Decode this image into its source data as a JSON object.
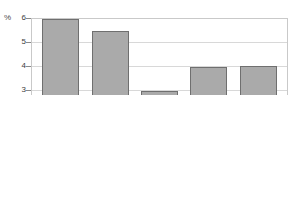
{
  "chart_data": {
    "type": "bar",
    "title": "",
    "subtitle": "",
    "xlabel": "",
    "ylabel": "%",
    "unit_label": "%",
    "categories": [
      "2006",
      "2007",
      "2008",
      "2009",
      "2010"
    ],
    "values": [
      4.0,
      6.0,
      5.5,
      3.0,
      4.0
    ],
    "series": [
      {
        "name": "",
        "values": [
          4.0,
          6.0,
          5.5,
          3.0,
          4.0
        ]
      }
    ],
    "ylim": [
      0,
      6
    ],
    "xlim_categories": 5,
    "ytick_labels": [
      "0",
      "1",
      "2",
      "3",
      "4",
      "5",
      "6"
    ],
    "ytick_values": [
      0,
      1,
      2,
      3,
      4,
      5,
      6
    ],
    "grid": true,
    "grid_axis": "y",
    "legend": false,
    "legend_position": "none",
    "annotations": [],
    "colors": {
      "bar_fill": "#aaaaaa",
      "bar_border": "#6f6f6f",
      "gridline": "#d8d8d8",
      "plot_border": "#c9c9c9",
      "axis_text": "#3c3c3c",
      "background": "#ffffff"
    }
  }
}
